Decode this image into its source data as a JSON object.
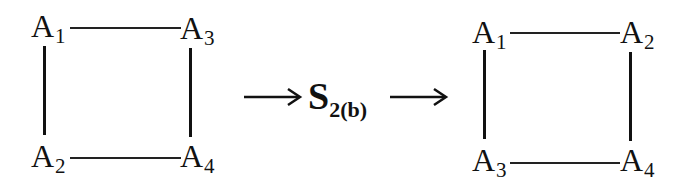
{
  "left_diagram": {
    "top_left": {
      "base": "A",
      "sub": "1"
    },
    "top_right": {
      "base": "A",
      "sub": "3"
    },
    "bottom_left": {
      "base": "A",
      "sub": "2"
    },
    "bottom_right": {
      "base": "A",
      "sub": "4"
    }
  },
  "operation": {
    "base": "S",
    "sub": "2(b)"
  },
  "right_diagram": {
    "top_left": {
      "base": "A",
      "sub": "1"
    },
    "top_right": {
      "base": "A",
      "sub": "2"
    },
    "bottom_left": {
      "base": "A",
      "sub": "3"
    },
    "bottom_right": {
      "base": "A",
      "sub": "4"
    }
  },
  "colors": {
    "ink": "#111111",
    "background": "#ffffff"
  }
}
